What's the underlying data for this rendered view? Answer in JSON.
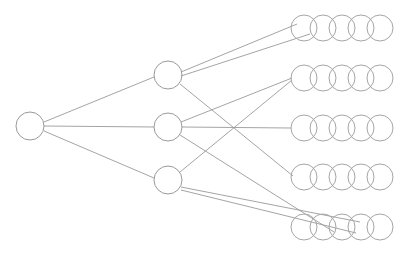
{
  "diagram": {
    "type": "node-link-diagram",
    "canvas": {
      "width": 411,
      "height": 257,
      "background": "#ffffff"
    },
    "style": {
      "edge_color": "#9a9a9a",
      "node_stroke_color": "#9a9a9a",
      "output_stroke_color": "#a6a6a6",
      "node_fill": "none",
      "edge_width": 0.9,
      "node_stroke_width": 1
    },
    "layers": [
      {
        "id": "input",
        "name": "input-layer",
        "node_count": 1,
        "node_radius": 14,
        "nodes": [
          {
            "id": "i1",
            "name": "input-node-1",
            "cx": 30,
            "cy": 126,
            "r": 14
          }
        ]
      },
      {
        "id": "hidden",
        "name": "hidden-layer",
        "node_count": 3,
        "node_radius": 14,
        "nodes": [
          {
            "id": "h1",
            "name": "hidden-node-1",
            "cx": 168,
            "cy": 75,
            "r": 14
          },
          {
            "id": "h2",
            "name": "hidden-node-2",
            "cx": 168,
            "cy": 127,
            "r": 14
          },
          {
            "id": "h3",
            "name": "hidden-node-3",
            "cx": 168,
            "cy": 180,
            "r": 14
          }
        ]
      },
      {
        "id": "output",
        "name": "output-layer",
        "group_count": 5,
        "circles_per_group": 5,
        "circle_radius": 13,
        "circle_spacing": 19,
        "first_circle_cx": 304,
        "groups": [
          {
            "id": "o1",
            "name": "output-group-1",
            "cy": 28
          },
          {
            "id": "o2",
            "name": "output-group-2",
            "cy": 78
          },
          {
            "id": "o3",
            "name": "output-group-3",
            "cy": 128
          },
          {
            "id": "o4",
            "name": "output-group-4",
            "cy": 177
          },
          {
            "id": "o5",
            "name": "output-group-5",
            "cy": 227
          }
        ]
      }
    ],
    "edges": [
      {
        "id": "e1",
        "name": "edge-input-to-hidden-1",
        "from": "i1",
        "to": "h1",
        "x1": 44,
        "y1": 122,
        "x2": 154,
        "y2": 77
      },
      {
        "id": "e2",
        "name": "edge-input-to-hidden-2",
        "from": "i1",
        "to": "h2",
        "x1": 44,
        "y1": 126,
        "x2": 154,
        "y2": 127
      },
      {
        "id": "e3",
        "name": "edge-input-to-hidden-3",
        "from": "i1",
        "to": "h3",
        "x1": 44,
        "y1": 131,
        "x2": 154,
        "y2": 178
      },
      {
        "id": "e4",
        "name": "edge-hidden-1-to-output-1a",
        "from": "h1",
        "to": "o1",
        "x1": 181,
        "y1": 72,
        "x2": 297,
        "y2": 24
      },
      {
        "id": "e5",
        "name": "edge-hidden-1-to-output-1b",
        "from": "h1",
        "to": "o1",
        "x1": 181,
        "y1": 76,
        "x2": 310,
        "y2": 34
      },
      {
        "id": "e6",
        "name": "edge-hidden-1-to-output-4",
        "from": "h1",
        "to": "o4",
        "x1": 180,
        "y1": 84,
        "x2": 293,
        "y2": 176
      },
      {
        "id": "e7",
        "name": "edge-hidden-2-to-output-2",
        "from": "h2",
        "to": "o2",
        "x1": 181,
        "y1": 122,
        "x2": 292,
        "y2": 78
      },
      {
        "id": "e8",
        "name": "edge-hidden-2-to-output-3",
        "from": "h2",
        "to": "o3",
        "x1": 182,
        "y1": 127,
        "x2": 291,
        "y2": 128
      },
      {
        "id": "e9",
        "name": "edge-hidden-2-to-output-5",
        "from": "h2",
        "to": "o5",
        "x1": 180,
        "y1": 135,
        "x2": 334,
        "y2": 232
      },
      {
        "id": "e10",
        "name": "edge-hidden-3-to-output-2",
        "from": "h3",
        "to": "o2",
        "x1": 180,
        "y1": 172,
        "x2": 292,
        "y2": 80
      },
      {
        "id": "e11",
        "name": "edge-hidden-3-to-output-5a",
        "from": "h3",
        "to": "o5",
        "x1": 181,
        "y1": 187,
        "x2": 360,
        "y2": 222
      },
      {
        "id": "e12",
        "name": "edge-hidden-3-to-output-5b",
        "from": "h3",
        "to": "o5",
        "x1": 181,
        "y1": 190,
        "x2": 356,
        "y2": 233
      }
    ]
  }
}
